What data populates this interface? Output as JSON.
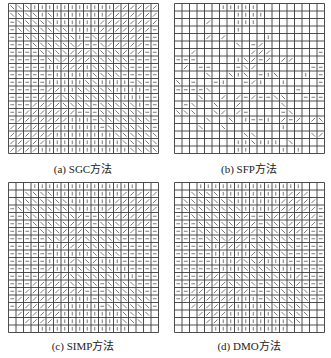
{
  "figure": {
    "grid": {
      "rows": 20,
      "cols": 20,
      "cell_px": 7.5,
      "line_color": "#3a3a3a",
      "fiber_color": "#555555"
    },
    "legend_codes": {
      "|": "vertical fiber (90°)",
      "-": "horizontal fiber (0°)",
      "b": "diagonal fiber (-45°, \\)",
      "f": "diagonal fiber (+45°, /)",
      ".": "empty / void cell"
    },
    "panels": [
      {
        "id": "a",
        "caption": "(a)  SGC方法",
        "x": 8,
        "y": 3,
        "cells": [
          "bbb|||||||||||ffffff",
          "bbbb|b|||||||fffffff",
          "-bbbbb||||||ffffffff",
          "-bbbbbbb||||fffffff-",
          "--bbbbbbb|-bffffff--",
          "---bbbbbbf--bfffff--",
          "----bbbbfffbbbbfff--",
          "-----bbffffbbbbb----",
          "-----||fff|bbbbb----",
          "------|||||bbbb-----",
          "-----|||||bb||||-b--",
          "-----ff||bbbbb||||--",
          "----fffbbbbbbbb|||--",
          "---ffffbbbb-bbbbb|--",
          "--fffffff---bbbbbb--",
          "-fffffff|||-bbbbbbb-",
          "fffffff|||||-bbbbbb-",
          "ffffff||||||||bbbbbb",
          "fffff||||||||||bbbbb",
          "ffff||||||||||||bbbb"
        ]
      },
      {
        "id": "b",
        "caption": "(b)  SFP方法",
        "x": 174,
        "y": 3,
        "cells": [
          "......|||||.........",
          "........||||........",
          "....f...|||.........",
          "........|...........",
          "....f.f.....|.......",
          "........b.-f........",
          "..f.......fff......-",
          "---.....|bf-f.ff....",
          ".f.--...-bf.......--",
          "....b..b|b.-|b...|.-",
          "b.-..-|..-f|..|....-",
          "----b...........-...",
          "...b..f.f-f--bb..---",
          ".-b..b..f.....b.....",
          "bbb..bf.f-....-b....",
          "....b..b.|--|.f-f.fb",
          "...b..b.......|.....",
          ".........bb.......bf",
          "........||b|||.b....",
          "........||....|.|..."
        ]
      },
      {
        "id": "c",
        "caption": "(c)  SIMP方法",
        "x": 8,
        "y": 182,
        "cells": [
          "...||||||||||||||...",
          "..bbbb|||||||||fffff",
          ".bbbbbbb||||||ffffff",
          "-bbbbbbbb||||fffffff",
          "--bbbbbbbf--bffffff-",
          "---bbbbbfff-bbbffff-",
          "----bbbfffbbbbbff---",
          "-----bbfffbbbbb-----",
          "-----||fffbbbbb-----",
          "------|||||bbbb-----",
          "-----|||fbbf|||-----",
          "-----f|||bbbbb||----",
          "----ffffbbbbbbb||---",
          "---fffffbbbb-bbbb---",
          "--ffffffff---bbbbb--",
          "-fffffff|||-bbbbbbb-",
          "-ffffff|||||-bbbbbb-",
          ".ffffff||||||||bbbb.",
          "..ffff|||||||||bbb..",
          "....||||||||||||...."
        ]
      },
      {
        "id": "d",
        "caption": "(d)  DMO方法",
        "x": 174,
        "y": 182,
        "cells": [
          "...||||||||||||||...",
          "..bbbb|||||||||fff..",
          ".bbbbbbb||||||fffff.",
          "-bbbbbbbb||||ffffff-",
          "--bbbbbbbf--bffffff-",
          "---bbbbbfff-bbbffff-",
          "---bbbbbfffbbbbfff--",
          "----bbbfff-bbbbb----",
          "----b|fff|bbbbbb----",
          "-----|||||fbbbb-----",
          "-----|||fbbf|||-----",
          "------|||bbbbb||----",
          "----fffbbbbbbbb|f---",
          "---ffffbbbb-bbbbf---",
          "--ffffffff---bbbbb--",
          "-fffffff|||-bbbbbb--",
          "..ffffff||||bbbbbb..",
          "...ffff||||||bbbbb..",
          "....ff|||||||||bb...",
          ".....||||||||||....."
        ]
      }
    ],
    "caption_positions": [
      {
        "id": "a",
        "cx": 83,
        "y": 160
      },
      {
        "id": "b",
        "cx": 249,
        "y": 160
      },
      {
        "id": "c",
        "cx": 83,
        "y": 337
      },
      {
        "id": "d",
        "cx": 249,
        "y": 337
      }
    ]
  }
}
